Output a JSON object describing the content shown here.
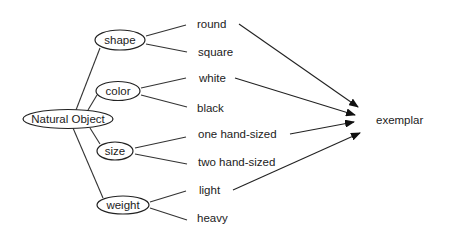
{
  "diagram": {
    "root": {
      "label": "Natural Object"
    },
    "attributes": [
      {
        "label": "shape",
        "values": [
          "round",
          "square"
        ]
      },
      {
        "label": "color",
        "values": [
          "white",
          "black"
        ]
      },
      {
        "label": "size",
        "values": [
          "one hand-sized",
          "two hand-sized"
        ]
      },
      {
        "label": "weight",
        "values": [
          "light",
          "heavy"
        ]
      }
    ],
    "target": {
      "label": "exemplar"
    },
    "arrows_from": [
      "round",
      "white",
      "one hand-sized",
      "light"
    ]
  }
}
